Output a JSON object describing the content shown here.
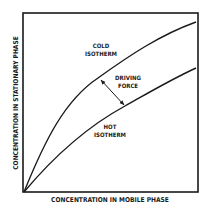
{
  "diagram": {
    "x_axis_label": "CONCENTRATION IN MOBILE PHASE",
    "y_axis_label": "CONCENTRATION IN STATIONARY PHASE",
    "curves": [
      {
        "name": "cold-isotherm",
        "label_line1": "COLD",
        "label_line2": "ISOTHERM"
      },
      {
        "name": "hot-isotherm",
        "label_line1": "HOT",
        "label_line2": "ISOTHERM"
      }
    ],
    "annotation": {
      "line1": "DRIVING",
      "line2": "FORCE"
    },
    "colors": {
      "line": "#1a1a1a",
      "background": "#ffffff"
    }
  }
}
